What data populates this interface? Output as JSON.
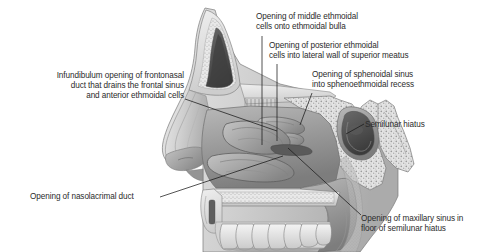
{
  "figure": {
    "background_color": "#ffffff",
    "text_color": "#2b2b2b",
    "leader_line_color": "#1a1a1a"
  },
  "labels": [
    {
      "id": "middle-ethmoidal",
      "text": "Opening of middle ethmoidal\ncells onto ethmoidal bulla",
      "align": "left",
      "x": 256,
      "y": 12
    },
    {
      "id": "posterior-ethmoidal",
      "text": "Opening of posterior ethmoidal\ncells into lateral wall of superior meatus",
      "align": "left",
      "x": 269,
      "y": 41
    },
    {
      "id": "sphenoidal-sinus",
      "text": "Opening of sphenoidal sinus\ninto sphenoethmoidal recess",
      "align": "left",
      "x": 312,
      "y": 70
    },
    {
      "id": "infundibulum",
      "text": "Infundibulum opening of frontonasal\nduct that drains the frontal sinus\nand anterior ethmoidal cells",
      "align": "right",
      "x": 14,
      "y": 71
    },
    {
      "id": "semilunar-hiatus",
      "text": "Semilunar hiatus",
      "align": "left",
      "x": 365,
      "y": 120
    },
    {
      "id": "nasolacrimal-duct",
      "text": "Opening of nasolacrimal duct",
      "align": "left",
      "x": 30,
      "y": 192
    },
    {
      "id": "maxillary-sinus",
      "text": "Opening of maxillary sinus in\nfloor of semilunar hiatus",
      "align": "left",
      "x": 361,
      "y": 214
    }
  ],
  "anatomy_regions": [
    "frontal-sinus",
    "nasal-bone",
    "cribriform-plate",
    "superior-concha",
    "middle-concha",
    "inferior-concha",
    "ethmoidal-bulla",
    "sphenoidal-sinus",
    "pterygoid-process",
    "hard-palate",
    "soft-palate",
    "upper-teeth",
    "nasal-vestibule"
  ]
}
